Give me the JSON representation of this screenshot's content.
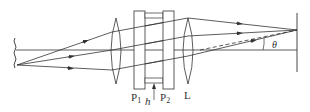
{
  "diagram": {
    "type": "optics-interference-setup",
    "labels": {
      "plate1": "P",
      "plate1_sub": "1",
      "plate2": "P",
      "plate2_sub": "2",
      "gap": "h",
      "lens": "L",
      "angle": "θ"
    },
    "colors": {
      "line": "#333333",
      "background": "#ffffff"
    },
    "components": [
      {
        "name": "extended-source",
        "kind": "wavy line"
      },
      {
        "name": "collimating-lens",
        "kind": "convex lens"
      },
      {
        "name": "plate-P1",
        "kind": "glass plate"
      },
      {
        "name": "air-gap-h",
        "kind": "spacer gap"
      },
      {
        "name": "plate-P2",
        "kind": "glass plate"
      },
      {
        "name": "focusing-lens-L",
        "kind": "convex lens"
      },
      {
        "name": "screen",
        "kind": "observation screen"
      }
    ]
  }
}
